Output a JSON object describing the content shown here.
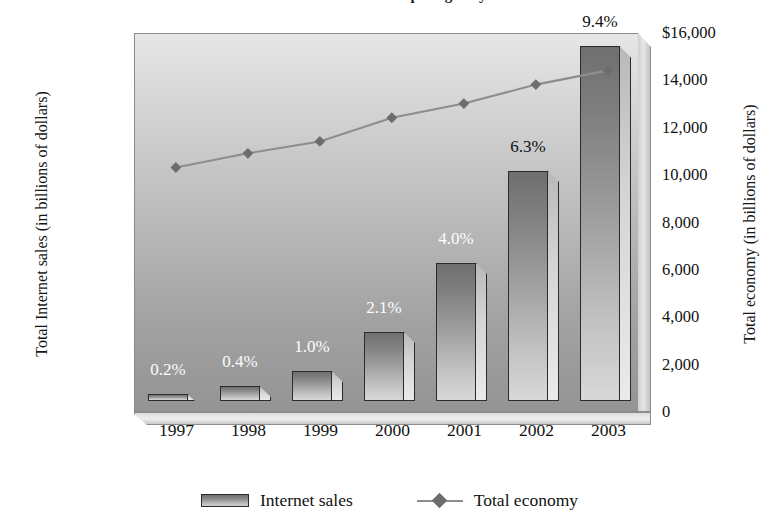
{
  "chart_data": {
    "type": "bar",
    "title": "Commerce and Superhighway",
    "categories": [
      "1997",
      "1998",
      "1999",
      "2000",
      "2001",
      "2002",
      "2003"
    ],
    "xlabel": "",
    "grid": false,
    "legend_position": "bottom",
    "series": [
      {
        "name": "Internet sales",
        "type": "bar",
        "axis": "left",
        "ylabel": "Total Internet sales (in billions of dollars)",
        "ylim": [
          0,
          1400
        ],
        "yticks": [
          "$1,400",
          "1,200",
          "1,000",
          "800",
          "600",
          "400",
          "200",
          "0"
        ],
        "ytick_values": [
          1400,
          1200,
          1000,
          800,
          600,
          400,
          200,
          0
        ],
        "values": [
          25,
          55,
          110,
          255,
          510,
          850,
          1310
        ],
        "data_labels": [
          "0.2%",
          "0.4%",
          "1.0%",
          "2.1%",
          "4.0%",
          "6.3%",
          "9.4%"
        ]
      },
      {
        "name": "Total economy",
        "type": "line",
        "axis": "right",
        "ylabel": "Total economy (in billions of dollars)",
        "ylim": [
          0,
          16000
        ],
        "yticks": [
          "$16,000",
          "14,000",
          "12,000",
          "10,000",
          "8,000",
          "6,000",
          "4,000",
          "2,000",
          "0"
        ],
        "ytick_values": [
          16000,
          14000,
          12000,
          10000,
          8000,
          6000,
          4000,
          2000,
          0
        ],
        "values": [
          9800,
          10400,
          10900,
          11900,
          12500,
          13300,
          13900
        ],
        "marker": "diamond"
      }
    ],
    "colors": {
      "bar_dark": "#6f6f6f",
      "bar_light": "#d8d8d8",
      "bar_outline": "#2b2b2b",
      "line": "#8d8d8d",
      "marker": "#6d6d6d",
      "plot_bg_top": "#e6e6e6",
      "plot_bg_bottom": "#949494",
      "text": "#111111",
      "label_on_dark": "#fdfdfd"
    }
  },
  "legend": {
    "items": [
      {
        "label": "Internet sales",
        "glyph": "bar-swatch-icon"
      },
      {
        "label": "Total economy",
        "glyph": "line-diamond-icon"
      }
    ]
  }
}
